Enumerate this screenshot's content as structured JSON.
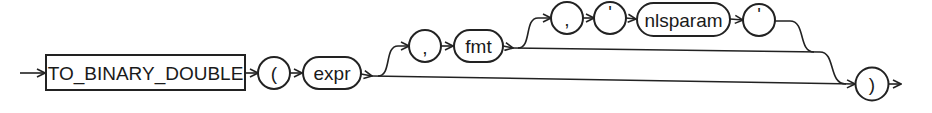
{
  "diagram": {
    "type": "railroad-syntax-diagram",
    "function_keyword": "TO_BINARY_DOUBLE",
    "open_paren": "(",
    "close_paren": ")",
    "expr": "expr",
    "comma_1": ",",
    "fmt": "fmt",
    "comma_2": ",",
    "quote_open": "'",
    "nlsparam": "nlsparam",
    "quote_close": "'",
    "colors": {
      "stroke": "#222222",
      "background": "#ffffff",
      "text": "#1a1a1a"
    }
  }
}
